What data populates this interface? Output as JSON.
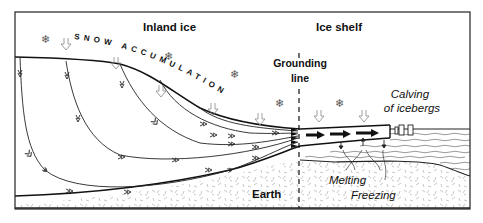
{
  "diagram": {
    "title_left": "Inland ice",
    "title_right": "Ice shelf",
    "snow_label": "SNOW ACCUMULATION",
    "grounding_line_label_1": "Grounding",
    "grounding_line_label_2": "line",
    "calving_label_1": "Calving",
    "calving_label_2": "of icebergs",
    "earth_label": "Earth",
    "melting_label": "Melting",
    "freezing_label": "Freezing",
    "icons": {
      "snowflake": "❄",
      "snow_arrow": "down-arrow-outline",
      "flow_arrow": "flow-chevron",
      "shelf_flow_arrow": "bold-right-arrow"
    },
    "colors": {
      "line": "#1a1a1a",
      "ground_texture": "#9a9a9a",
      "water": "#555555",
      "snow_arrow": "#888888"
    }
  }
}
